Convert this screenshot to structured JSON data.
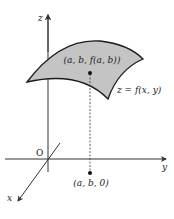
{
  "diagram": {
    "type": "3d-surface-graph",
    "axes": {
      "x_label": "x",
      "y_label": "y",
      "z_label": "z",
      "origin_label": "O"
    },
    "surface": {
      "label": "z = f(x, y)",
      "fill_color": "#c4c4c4",
      "stroke_color": "#1a1a1a"
    },
    "points": {
      "on_surface": "(a, b, f(a, b))",
      "on_plane": "(a, b, 0)"
    },
    "colors": {
      "axis": "#333333",
      "dashed_line": "#333333",
      "text": "#222222"
    }
  }
}
